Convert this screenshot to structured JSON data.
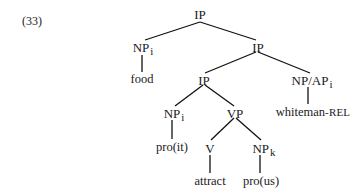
{
  "example_number": "(33)",
  "tree": {
    "root": {
      "label": "IP"
    },
    "subject": {
      "label": "NP",
      "index": "i",
      "word": "food"
    },
    "ip_mid": {
      "label": "IP"
    },
    "ip_low": {
      "label": "IP"
    },
    "np_ap": {
      "label": "NP/AP",
      "index": "i",
      "word_main": "whiteman",
      "word_suffix": "-REL"
    },
    "np_pro_it": {
      "label": "NP",
      "index": "i",
      "word": "pro(it)"
    },
    "vp": {
      "label": "VP"
    },
    "v": {
      "label": "V",
      "word": "attract"
    },
    "np_pro_us": {
      "label": "NP",
      "index": "k",
      "word": "pro(us)"
    }
  }
}
